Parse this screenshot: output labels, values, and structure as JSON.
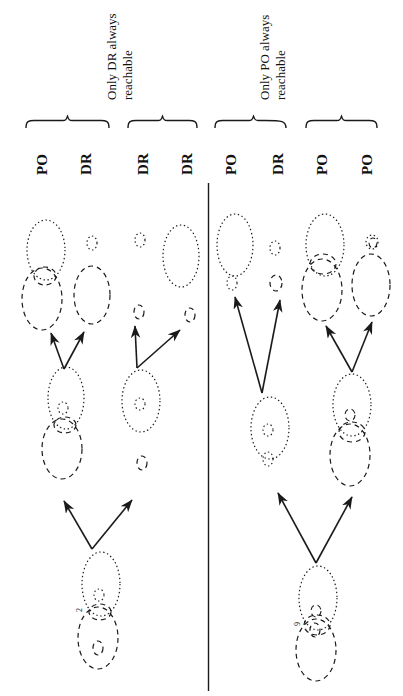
{
  "figure": {
    "type": "reachability-venn-diagram",
    "orientation": "rotated-90-ccw",
    "divider": {
      "name": "center-vertical-divider",
      "color": "#1a1a1a"
    },
    "ink_color": "#1a1a1a"
  },
  "captions": [
    {
      "id": "cap-left",
      "line1": "Only DR always",
      "line2": "reachable"
    },
    {
      "id": "cap-right",
      "line1": "Only PO always",
      "line2": "reachable"
    }
  ],
  "groups": [
    {
      "id": "g1",
      "brace": "brace-1",
      "labels": [
        "PO",
        "DR"
      ]
    },
    {
      "id": "g2",
      "brace": "brace-2",
      "labels": [
        "DR",
        "DR"
      ]
    },
    {
      "id": "g3",
      "brace": "brace-3",
      "labels": [
        "PO",
        "DR"
      ]
    },
    {
      "id": "g4",
      "brace": "brace-4",
      "labels": [
        "PO",
        "PO"
      ]
    }
  ],
  "node_annotations": [
    {
      "id": "ann-left",
      "text": "2"
    },
    {
      "id": "ann-right",
      "text": "9"
    }
  ],
  "legend": {
    "dotted_style": "dotted",
    "dashed_style": "dashed",
    "arrow_style": "solid"
  }
}
